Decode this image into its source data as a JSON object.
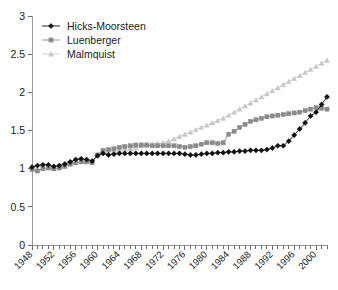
{
  "chart_data": {
    "type": "line",
    "title": "",
    "subtitle": "",
    "xlabel": "",
    "ylabel": "",
    "xlim": [
      1948,
      2002
    ],
    "ylim": [
      0,
      3
    ],
    "yticks": [
      "0",
      "0.5",
      "1",
      "1.5",
      "2",
      "2.5",
      "3"
    ],
    "ytick_values": [
      0,
      0.5,
      1,
      1.5,
      2,
      2.5,
      3
    ],
    "xtick_labels": [
      "1948",
      "1952",
      "1956",
      "1960",
      "1964",
      "1968",
      "1972",
      "1976",
      "1980",
      "1984",
      "1988",
      "1992",
      "1996",
      "2000"
    ],
    "xtick_values": [
      1948,
      1952,
      1956,
      1960,
      1964,
      1968,
      1972,
      1976,
      1980,
      1984,
      1988,
      1992,
      1996,
      2000
    ],
    "grid": false,
    "legend_position": "top-left",
    "x": [
      1948,
      1949,
      1950,
      1951,
      1952,
      1953,
      1954,
      1955,
      1956,
      1957,
      1958,
      1959,
      1960,
      1961,
      1962,
      1963,
      1964,
      1965,
      1966,
      1967,
      1968,
      1969,
      1970,
      1971,
      1972,
      1973,
      1974,
      1975,
      1976,
      1977,
      1978,
      1979,
      1980,
      1981,
      1982,
      1983,
      1984,
      1985,
      1986,
      1987,
      1988,
      1989,
      1990,
      1991,
      1992,
      1993,
      1994,
      1995,
      1996,
      1997,
      1998,
      1999,
      2000,
      2001,
      2002
    ],
    "series": [
      {
        "name": "Hicks-Moorsteen",
        "color": "#111111",
        "marker": "diamond",
        "values": [
          1.02,
          1.04,
          1.05,
          1.05,
          1.03,
          1.04,
          1.06,
          1.09,
          1.12,
          1.13,
          1.12,
          1.1,
          1.17,
          1.2,
          1.18,
          1.19,
          1.2,
          1.2,
          1.2,
          1.2,
          1.2,
          1.2,
          1.2,
          1.2,
          1.2,
          1.2,
          1.2,
          1.2,
          1.19,
          1.18,
          1.18,
          1.19,
          1.2,
          1.2,
          1.21,
          1.21,
          1.22,
          1.22,
          1.23,
          1.23,
          1.24,
          1.24,
          1.24,
          1.25,
          1.27,
          1.3,
          1.3,
          1.36,
          1.44,
          1.52,
          1.6,
          1.69,
          1.74,
          1.84,
          1.94
        ]
      },
      {
        "name": "Luenberger",
        "color": "#8a8a8a",
        "marker": "square",
        "values": [
          0.99,
          0.97,
          1.0,
          1.01,
          1.0,
          1.01,
          1.03,
          1.06,
          1.08,
          1.09,
          1.09,
          1.08,
          1.18,
          1.24,
          1.25,
          1.26,
          1.28,
          1.29,
          1.3,
          1.31,
          1.31,
          1.31,
          1.3,
          1.3,
          1.3,
          1.3,
          1.3,
          1.29,
          1.28,
          1.29,
          1.3,
          1.32,
          1.34,
          1.34,
          1.33,
          1.34,
          1.45,
          1.49,
          1.54,
          1.58,
          1.62,
          1.64,
          1.66,
          1.68,
          1.69,
          1.7,
          1.71,
          1.72,
          1.73,
          1.74,
          1.76,
          1.78,
          1.8,
          1.79,
          1.78
        ]
      },
      {
        "name": "Malmquist",
        "color": "#c8c8c8",
        "marker": "triangle",
        "values": [
          1.0,
          0.98,
          1.0,
          1.01,
          1.0,
          1.01,
          1.03,
          1.06,
          1.08,
          1.09,
          1.09,
          1.08,
          1.17,
          1.21,
          1.22,
          1.23,
          1.24,
          1.25,
          1.26,
          1.28,
          1.3,
          1.31,
          1.32,
          1.33,
          1.34,
          1.36,
          1.39,
          1.42,
          1.45,
          1.48,
          1.51,
          1.54,
          1.57,
          1.6,
          1.63,
          1.66,
          1.7,
          1.74,
          1.78,
          1.82,
          1.86,
          1.9,
          1.94,
          1.98,
          2.02,
          2.06,
          2.1,
          2.14,
          2.18,
          2.22,
          2.26,
          2.3,
          2.34,
          2.38,
          2.42
        ]
      }
    ]
  },
  "legend": {
    "items": [
      {
        "label": "Hicks-Moorsteen"
      },
      {
        "label": "Luenberger"
      },
      {
        "label": "Malmquist"
      }
    ]
  }
}
